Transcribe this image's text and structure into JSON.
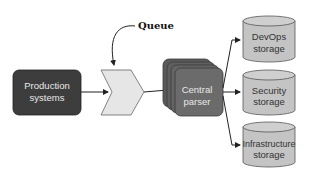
{
  "diagram": {
    "nodes": {
      "production": {
        "line1": "Production",
        "line2": "systems"
      },
      "queue": {
        "label": "Queue"
      },
      "parser": {
        "line1": "Central",
        "line2": "parser"
      },
      "devops": {
        "line1": "DevOps",
        "line2": "storage"
      },
      "security": {
        "line1": "Security",
        "line2": "storage"
      },
      "infra": {
        "line1": "Infrastructure",
        "line2": "storage"
      }
    },
    "colors": {
      "dark_box": "#3d3d3d",
      "queue_fill": "#e6e6e6",
      "parser_fill": "#6b6b6b",
      "storage_fill": "#c4c4c4",
      "stroke": "#222222"
    },
    "edges": [
      {
        "from": "production",
        "to": "queue"
      },
      {
        "from": "queue",
        "to": "parser"
      },
      {
        "from": "parser",
        "to": "devops"
      },
      {
        "from": "parser",
        "to": "security"
      },
      {
        "from": "parser",
        "to": "infra"
      },
      {
        "from": "queue-label",
        "to": "queue",
        "type": "callout"
      }
    ]
  }
}
